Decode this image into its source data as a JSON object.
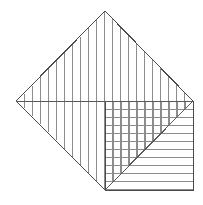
{
  "canvas": {
    "width": 203,
    "height": 205,
    "background": "#ffffff",
    "title": "Hatched diamond and square geometric figure"
  },
  "style": {
    "outline_color": "#4a4a4a",
    "hatch_color": "#8c8c8c",
    "diagonal_color": "#5a5a5a",
    "outline_width": 1,
    "hatch_width": 1
  },
  "figure": {
    "shapes": [
      {
        "name": "diamond",
        "type": "polygon",
        "points": [
          [
            105,
            11
          ],
          [
            193,
            101
          ],
          [
            105,
            190
          ],
          [
            16,
            101
          ]
        ],
        "hatch": "vertical",
        "hatch_spacing": 8,
        "label": "rotated square"
      },
      {
        "name": "square",
        "type": "rect",
        "x": 105,
        "y": 101,
        "width": 88,
        "height": 89,
        "hatch": "horizontal",
        "hatch_spacing": 8,
        "label": "axis aligned square"
      }
    ],
    "lines": [
      {
        "name": "horizontal-diagonal",
        "from": [
          16,
          101
        ],
        "to": [
          193,
          101
        ]
      },
      {
        "name": "square-anti-diagonal",
        "from": [
          105,
          190
        ],
        "to": [
          193,
          101
        ]
      }
    ],
    "vertices": {
      "diamond_top": [
        105,
        11
      ],
      "diamond_left": [
        16,
        101
      ],
      "diamond_right": [
        193,
        101
      ],
      "diamond_bottom": [
        105,
        190
      ],
      "square_top_left": [
        105,
        101
      ],
      "square_bottom_right": [
        193,
        190
      ]
    },
    "hatch_regions": [
      {
        "name": "diamond-vertical-hatch",
        "direction": "vertical",
        "spacing": 8,
        "count": 22
      },
      {
        "name": "square-horizontal-hatch",
        "direction": "horizontal",
        "spacing": 8,
        "count": 11
      },
      {
        "name": "square-upper-triangle-vertical-hatch",
        "direction": "vertical",
        "spacing": 8,
        "count": 11
      }
    ]
  }
}
